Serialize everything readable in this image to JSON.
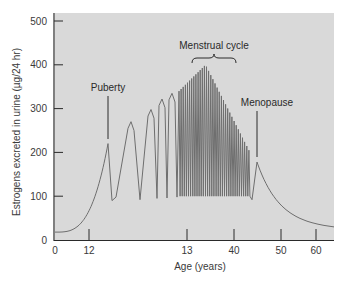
{
  "chart_data": {
    "type": "line",
    "title": "",
    "xlabel": "Age (years)",
    "ylabel": "Estrogens excreted in urine (µg/24 hr)",
    "ylim": [
      0,
      500
    ],
    "y_ticks": [
      0,
      100,
      200,
      300,
      400,
      500
    ],
    "x_ticks": [
      "0",
      "12",
      "13",
      "40",
      "50",
      "60"
    ],
    "x_axis_note": "Non-linear (broken) age axis; menstrual cycle span 13-40 compressed",
    "grid": false,
    "legend": null,
    "colors": {
      "plot_background": "#d9d9d9",
      "line": "#6e6e6e",
      "axis": "#2a2a2a",
      "text": "#3a3a3a"
    },
    "annotations": [
      {
        "label": "Puberty",
        "at_value": 220
      },
      {
        "label": "Menstrual cycle",
        "type": "bracket",
        "peak_value": 400
      },
      {
        "label": "Menopause",
        "at_value": 178
      }
    ],
    "series": [
      {
        "name": "Estrogen excretion",
        "description": "Baseline ~18 rising to puberty peak ~220; cyclic peaks ~270, ~298, ~322, ~335 with troughs ~90-100; dense menstrual cycle oscillations peaking ~400 then declining; menopause peak ~178 then decay to ~30",
        "key_points": [
          {
            "phase": "childhood start",
            "value": 18
          },
          {
            "phase": "puberty peak",
            "value": 220
          },
          {
            "phase": "cycle peak 2",
            "value": 270
          },
          {
            "phase": "cycle peak 3",
            "value": 298
          },
          {
            "phase": "cycle peak 4",
            "value": 322
          },
          {
            "phase": "cycle peak 5",
            "value": 335
          },
          {
            "phase": "menstrual cycle max",
            "value": 400
          },
          {
            "phase": "trough typical",
            "value": 95
          },
          {
            "phase": "menopause peak",
            "value": 178
          },
          {
            "phase": "post-menopause end",
            "value": 30
          }
        ]
      }
    ]
  },
  "labels": {
    "ylabel": "Estrogens excreted in urine (µg/24 hr)",
    "xlabel": "Age (years)",
    "puberty": "Puberty",
    "menstrual": "Menstrual cycle",
    "menopause": "Menopause"
  }
}
